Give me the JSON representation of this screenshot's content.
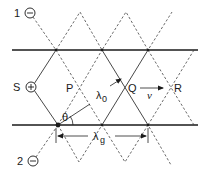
{
  "diagram": {
    "type": "waveguide-wave-interference",
    "colors": {
      "ink": "#1a1a1a",
      "background": "#ffffff"
    },
    "sources": [
      {
        "id": "1",
        "label": "1",
        "symbol": "minus",
        "symbol_glyph": "−"
      },
      {
        "id": "S",
        "label": "S",
        "symbol": "plus",
        "symbol_glyph": "+"
      },
      {
        "id": "2",
        "label": "2",
        "symbol": "minus",
        "symbol_glyph": "−"
      }
    ],
    "points": [
      {
        "id": "P",
        "label": "P"
      },
      {
        "id": "Q",
        "label": "Q"
      },
      {
        "id": "R",
        "label": "R"
      }
    ],
    "labels": {
      "free_wavelength": "λ",
      "free_wavelength_sub": "0",
      "guide_wavelength": "λ",
      "guide_wavelength_sub": "g",
      "angle": "θ",
      "velocity": "v"
    }
  }
}
